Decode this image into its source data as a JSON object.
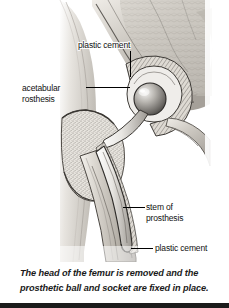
{
  "figure": {
    "alt_name": "hip-replacement-anatomical-illustration",
    "labels": {
      "plastic_cement_top": "plastic cement",
      "acetabular_line1": "acetabular",
      "acetabular_line2": "rosthesis",
      "stem_line1": "stem of",
      "stem_line2": "prosthesis",
      "plastic_cement_bottom": "plastic cement"
    }
  },
  "caption": {
    "line1": "The head of the femur is removed and the",
    "line2": "prosthetic ball and socket are fixed in place."
  },
  "colors": {
    "background": "#ffffff",
    "ink": "#111111",
    "bone_light": "#d9d6d0",
    "bone_mid": "#b4b0a9",
    "bone_dark": "#7d7974",
    "outline": "#2b2b2b",
    "bottom_bar": "#1b1b1b"
  }
}
